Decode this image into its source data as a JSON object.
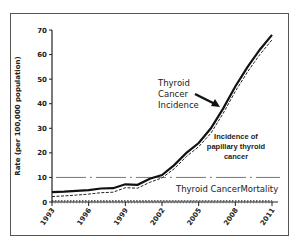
{
  "chart_data": {
    "type": "line",
    "title": "",
    "xlabel": "",
    "ylabel": "Rate (per 100,000 population)",
    "ylim": [
      0,
      70
    ],
    "yticks": [
      0,
      10,
      20,
      30,
      40,
      50,
      60,
      70
    ],
    "xticks": [
      1993,
      1996,
      1999,
      2002,
      2005,
      2008,
      2011
    ],
    "x": [
      1993,
      1994,
      1995,
      1996,
      1997,
      1998,
      1999,
      2000,
      2001,
      2002,
      2003,
      2004,
      2005,
      2006,
      2007,
      2008,
      2009,
      2010,
      2011
    ],
    "series": [
      {
        "name": "Thyroid Cancer Incidence",
        "style": "solid",
        "values": [
          4,
          4.2,
          4.5,
          4.8,
          5.5,
          5.6,
          7.2,
          7,
          9.5,
          11,
          15,
          20,
          24,
          30,
          38,
          47,
          55,
          62,
          68
        ]
      },
      {
        "name": "Incidence of papillary thyroid cancer",
        "style": "dashed",
        "values": [
          2.2,
          2.5,
          2.8,
          3.2,
          3.8,
          4,
          5.8,
          5.6,
          8,
          9.8,
          13.5,
          18.5,
          22.5,
          28,
          36,
          45,
          53,
          60,
          66
        ]
      },
      {
        "name": "Thyroid Cancer Mortality",
        "style": "dotted",
        "values": [
          0.5,
          0.5,
          0.5,
          0.5,
          0.5,
          0.5,
          0.5,
          0.5,
          0.5,
          0.5,
          0.5,
          0.5,
          0.5,
          0.5,
          0.5,
          0.5,
          0.5,
          0.5,
          0.5
        ]
      }
    ],
    "reference_line": {
      "y": 10,
      "style": "dash-dot"
    },
    "annotations": [
      {
        "text": [
          "Thyroid",
          "Cancer",
          "Incidence"
        ],
        "arrow_to_series": "Thyroid Cancer Incidence"
      },
      {
        "text": [
          "Incidence of",
          "papillary thyroid",
          "cancer"
        ]
      },
      {
        "text": [
          "Thyroid CancerMortality"
        ]
      }
    ],
    "grid": false,
    "legend": "none (inline annotations)"
  }
}
